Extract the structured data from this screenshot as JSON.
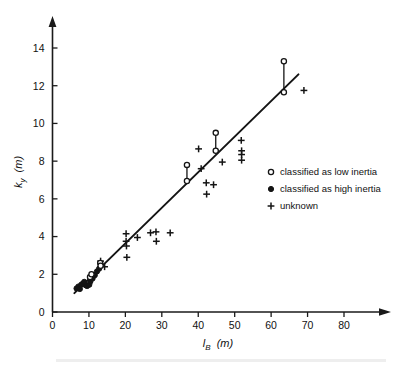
{
  "chart_data": {
    "type": "scatter",
    "title": "",
    "xlabel": "l_B (m)",
    "xlabel_symbol": "l",
    "xlabel_subscript": "B",
    "xlabel_unit": "(m)",
    "ylabel": "k_y (m)",
    "ylabel_symbol": "k",
    "ylabel_subscript": "y",
    "ylabel_unit": "(m)",
    "xlim": [
      0,
      88
    ],
    "ylim": [
      0,
      15.3
    ],
    "xticks": [
      0,
      10,
      20,
      30,
      40,
      50,
      60,
      70,
      80
    ],
    "yticks": [
      0,
      2,
      4,
      6,
      8,
      10,
      12,
      14
    ],
    "xtick_labels": [
      "0",
      "10",
      "20",
      "30",
      "40",
      "50",
      "60",
      "70",
      "80"
    ],
    "ytick_labels": [
      "0",
      "2",
      "4",
      "6",
      "8",
      "10",
      "12",
      "14"
    ],
    "grid": false,
    "axis_arrows": true,
    "legend_position": "right-middle",
    "legend": [
      {
        "marker": "open-circle",
        "label": "classified as low inertia"
      },
      {
        "marker": "filled-circle",
        "label": "classified as high inertia"
      },
      {
        "marker": "plus",
        "label": "unknown"
      }
    ],
    "fit_line": {
      "name": "regression line",
      "x0": 6.0,
      "y0": 1.0,
      "x1": 67.5,
      "y1": 12.6
    },
    "series": [
      {
        "name": "classified as high inertia",
        "marker": "filled-circle",
        "points": [
          [
            6.6,
            1.25
          ],
          [
            7.1,
            1.35
          ],
          [
            7.5,
            1.22
          ],
          [
            7.9,
            1.45
          ],
          [
            8.3,
            1.5
          ],
          [
            8.7,
            1.6
          ],
          [
            9.1,
            1.42
          ],
          [
            9.5,
            1.38
          ],
          [
            10.1,
            1.45
          ],
          [
            10.4,
            1.62
          ],
          [
            11.0,
            1.78
          ],
          [
            11.6,
            1.95
          ],
          [
            12.2,
            2.15
          ],
          [
            12.8,
            2.3
          ]
        ]
      },
      {
        "name": "classified as low inertia",
        "marker": "open-circle",
        "points": [
          [
            10.3,
            1.85
          ],
          [
            10.7,
            2.0
          ],
          [
            13.1,
            2.6
          ],
          [
            13.2,
            2.45
          ],
          [
            36.9,
            7.8
          ],
          [
            36.9,
            6.95
          ],
          [
            44.8,
            9.5
          ],
          [
            44.8,
            8.55
          ],
          [
            63.5,
            13.3
          ],
          [
            63.5,
            11.65
          ]
        ]
      },
      {
        "name": "unknown",
        "marker": "plus",
        "points": [
          [
            13.2,
            2.7
          ],
          [
            14.3,
            2.4
          ],
          [
            20.2,
            4.15
          ],
          [
            20.2,
            3.75
          ],
          [
            20.3,
            3.5
          ],
          [
            20.4,
            2.9
          ],
          [
            23.3,
            3.95
          ],
          [
            26.9,
            4.2
          ],
          [
            28.4,
            4.25
          ],
          [
            28.5,
            3.75
          ],
          [
            32.3,
            4.2
          ],
          [
            40.1,
            8.65
          ],
          [
            40.8,
            7.6
          ],
          [
            42.2,
            6.85
          ],
          [
            42.3,
            6.25
          ],
          [
            44.2,
            6.75
          ],
          [
            46.6,
            7.95
          ],
          [
            51.8,
            9.1
          ],
          [
            51.9,
            8.55
          ],
          [
            51.9,
            8.35
          ],
          [
            51.9,
            8.05
          ],
          [
            69.0,
            11.75
          ]
        ]
      }
    ],
    "paired_markers": [
      {
        "x": 36.9,
        "y_top": 7.8,
        "y_bottom": 6.95
      },
      {
        "x": 44.8,
        "y_top": 9.5,
        "y_bottom": 8.55
      },
      {
        "x": 63.5,
        "y_top": 13.3,
        "y_bottom": 11.65
      },
      {
        "x": 10.5,
        "y_top": 2.0,
        "y_bottom": 1.78
      },
      {
        "x": 13.15,
        "y_top": 2.6,
        "y_bottom": 2.45
      }
    ]
  }
}
